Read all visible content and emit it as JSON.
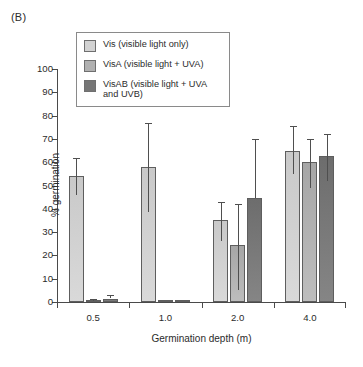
{
  "panel_label": "(B)",
  "legend": {
    "items": [
      {
        "name": "Vis",
        "label": "Vis (visible light only)",
        "color": "#d2d2d2"
      },
      {
        "name": "VisA",
        "label": "VisA (visible light + UVA)",
        "color": "#b0b0b0"
      },
      {
        "name": "VisAB",
        "label": "VisAB (visible light + UVA\nand UVB)",
        "color": "#767676"
      }
    ]
  },
  "chart_data": {
    "type": "bar",
    "title": "",
    "xlabel": "Germination depth (m)",
    "ylabel": "% germination",
    "categories": [
      "0.5",
      "1.0",
      "2.0",
      "4.0"
    ],
    "ylim": [
      0,
      100
    ],
    "yticks": [
      0,
      10,
      20,
      30,
      40,
      50,
      60,
      70,
      80,
      90,
      100
    ],
    "grid": false,
    "legend_position": "top-left-inside",
    "series": [
      {
        "name": "Vis",
        "label": "Vis (visible light only)",
        "color": "#d2d2d2",
        "values": [
          54,
          58,
          35,
          65
        ],
        "err_low": [
          46,
          38.5,
          26,
          55
        ],
        "err_high": [
          62,
          77,
          43,
          75.5
        ]
      },
      {
        "name": "VisA",
        "label": "VisA (visible light + UVA)",
        "color": "#b0b0b0",
        "values": [
          0.5,
          0.8,
          24.5,
          60
        ],
        "err_low": [
          0.5,
          0.8,
          5,
          49
        ],
        "err_high": [
          1.2,
          0.8,
          42,
          70
        ]
      },
      {
        "name": "VisAB",
        "label": "VisAB (visible light + UVA and UVB)",
        "color": "#767676",
        "values": [
          1.5,
          0.8,
          44.5,
          62.5
        ],
        "err_low": [
          1.5,
          0.8,
          44.5,
          52
        ],
        "err_high": [
          3.2,
          0.8,
          70,
          72
        ]
      }
    ]
  }
}
